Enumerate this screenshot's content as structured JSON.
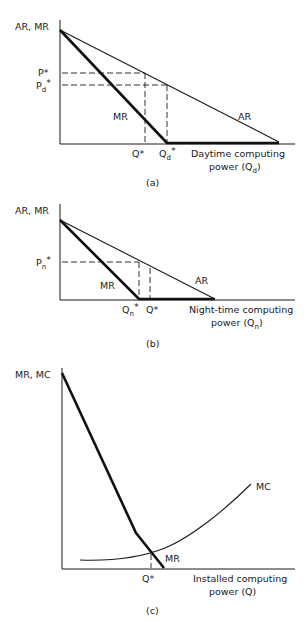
{
  "panels": [
    {
      "id": "a",
      "caption": "(a)",
      "y_axis_label": "AR, MR",
      "x_axis_label_line1": "Daytime computing",
      "x_axis_label_line2_pre": "power (Q",
      "x_axis_label_line2_sub": "d",
      "x_axis_label_line2_post": ")",
      "curve_labels": {
        "ar": "AR",
        "mr": "MR"
      },
      "price_labels": [
        {
          "main": "P*",
          "sub": ""
        },
        {
          "main": "P",
          "sub": "d",
          "sup": "*"
        }
      ],
      "quantity_labels": [
        {
          "main": "Q*",
          "sub": ""
        },
        {
          "main": "Q",
          "sub": "d",
          "sup": "*"
        }
      ]
    },
    {
      "id": "b",
      "caption": "(b)",
      "y_axis_label": "AR, MR",
      "x_axis_label_line1": "Night-time computing",
      "x_axis_label_line2_pre": "power (Q",
      "x_axis_label_line2_sub": "n",
      "x_axis_label_line2_post": ")",
      "curve_labels": {
        "ar": "AR",
        "mr": "MR"
      },
      "price_labels": [
        {
          "main": "P",
          "sub": "n",
          "sup": "*"
        }
      ],
      "quantity_labels": [
        {
          "main": "Q",
          "sub": "n",
          "sup": "*"
        },
        {
          "main": "Q*",
          "sub": ""
        }
      ]
    },
    {
      "id": "c",
      "caption": "(c)",
      "y_axis_label": "MR, MC",
      "x_axis_label_line1": "Installed computing",
      "x_axis_label_line2_pre": "power (Q",
      "x_axis_label_line2_sub": "",
      "x_axis_label_line2_post": ")",
      "curve_labels": {
        "mc": "MC",
        "mr": "MR"
      },
      "quantity_labels": [
        {
          "main": "Q*",
          "sub": ""
        }
      ]
    }
  ]
}
